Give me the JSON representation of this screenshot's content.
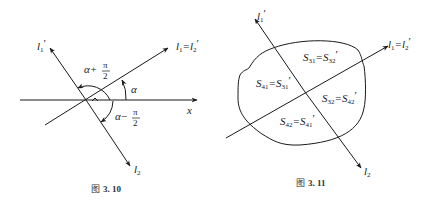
{
  "figures": [
    {
      "id": "fig-3-10",
      "caption": {
        "prefix": "图",
        "number": "3. 10"
      },
      "labels": {
        "l1_prime": "l",
        "l1_prime_sub": "1",
        "l1_prime_mark": "′",
        "l1_eq_l2p": "l",
        "l1_eq_l2p_sub1": "1",
        "l1_eq_l2p_eq": "=l",
        "l1_eq_l2p_sub2": "2",
        "l1_eq_l2p_mark": "′",
        "x_axis": "x",
        "alpha": "α",
        "alpha_plus": "α+",
        "alpha_minus": "α−",
        "pi": "π",
        "two": "2",
        "l2": "l",
        "l2_sub": "2"
      }
    },
    {
      "id": "fig-3-11",
      "caption": {
        "prefix": "图",
        "number": "3. 11"
      },
      "labels": {
        "l1_prime": "l",
        "l1_prime_sub": "1",
        "l1_prime_mark": "′",
        "l1_eq_l2p": "l",
        "l1_eq_l2p_sub1": "1",
        "l1_eq_l2p_eq": "=l",
        "l1_eq_l2p_sub2": "2",
        "l1_eq_l2p_mark": "′",
        "l2": "l",
        "l2_sub": "2",
        "regions": [
          {
            "a": "S",
            "a_sub": "31",
            "eq": "=S",
            "b_sub": "32",
            "mark": "′"
          },
          {
            "a": "S",
            "a_sub": "41",
            "eq": "=S",
            "b_sub": "31",
            "mark": "′"
          },
          {
            "a": "S",
            "a_sub": "32",
            "eq": "=S",
            "b_sub": "42",
            "mark": "′"
          },
          {
            "a": "S",
            "a_sub": "42",
            "eq": "=S",
            "b_sub": "41",
            "mark": "′"
          }
        ]
      }
    }
  ]
}
